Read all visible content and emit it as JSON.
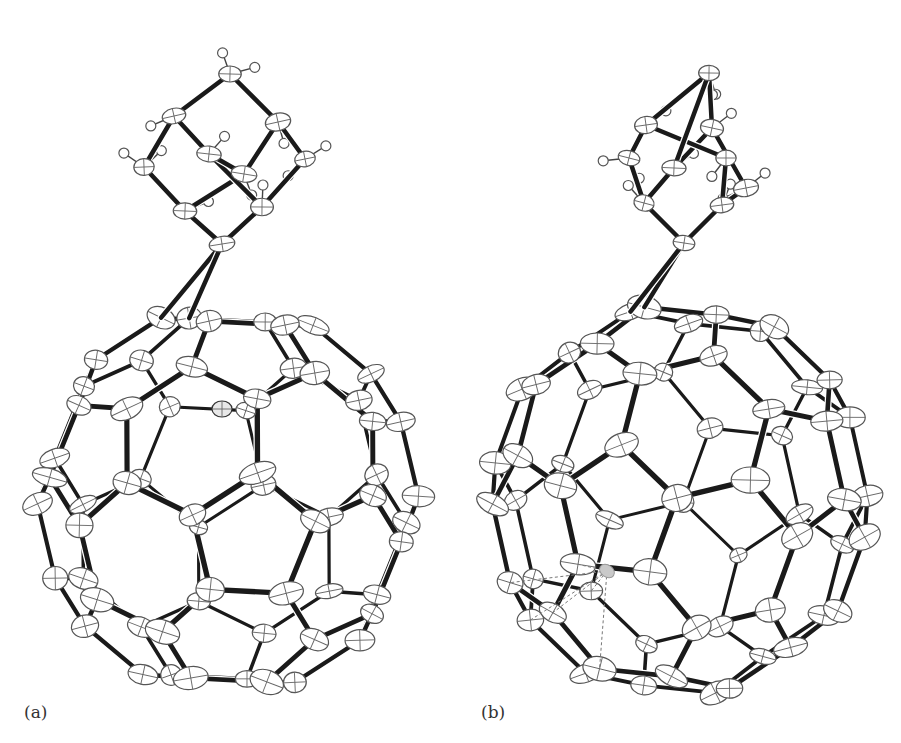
{
  "figure": {
    "panels": [
      {
        "id": "a",
        "label": "(a)",
        "guest_atom": {
          "x": 222,
          "y": 409,
          "rx": 10,
          "ry": 8
        },
        "cage": {
          "cx": 228,
          "cy": 500,
          "rx": 205,
          "ry": 210
        },
        "adamantane_apex": {
          "x": 222,
          "y": 244
        }
      },
      {
        "id": "b",
        "label": "(b)",
        "guest_atom": {
          "x": 607,
          "y": 571,
          "rx": 8,
          "ry": 6
        },
        "cage": {
          "cx": 680,
          "cy": 500,
          "rx": 205,
          "ry": 215
        },
        "adamantane_apex": {
          "x": 684,
          "y": 243
        }
      }
    ],
    "colors": {
      "bond": "#1a1a1a",
      "atom_outline": "#555555",
      "background": "#ffffff"
    }
  }
}
